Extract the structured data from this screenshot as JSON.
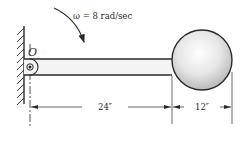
{
  "diagram": {
    "angular_velocity_label": "ω = 8 rad/sec",
    "pivot_label": "O",
    "dimensions": [
      {
        "label": "24″",
        "description": "pivot to ball edge"
      },
      {
        "label": "12″",
        "description": "ball diameter"
      }
    ],
    "colors": {
      "line": "#2a2a2a",
      "bar_fill": "#f4f4f4",
      "ball_light": "#ffffff",
      "ball_dark": "#b8b8b8"
    }
  }
}
